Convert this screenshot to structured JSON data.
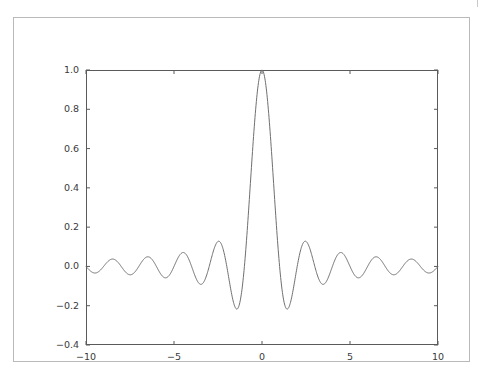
{
  "figure": {
    "background_color": "#ffffff",
    "frame_color": "#b9b9b9",
    "axes_color": "#5a5a5a",
    "line_color": "#6f6f6f",
    "tick_label_color": "#3a3a3a"
  },
  "chart_data": {
    "type": "line",
    "title": "",
    "xlabel": "",
    "ylabel": "",
    "xlim": [
      -10,
      10
    ],
    "ylim": [
      -0.4,
      1.0
    ],
    "grid": false,
    "legend": null,
    "xticks": [
      -10,
      -5,
      0,
      5,
      10
    ],
    "xticklabels": [
      "−10",
      "−5",
      "0",
      "5",
      "10"
    ],
    "yticks": [
      -0.4,
      -0.2,
      0.0,
      0.2,
      0.4,
      0.6,
      0.8,
      1.0
    ],
    "yticklabels": [
      "−0.4",
      "−0.2",
      "0.0",
      "0.2",
      "0.4",
      "0.6",
      "0.8",
      "1.0"
    ],
    "series": [
      {
        "name": "sinc(x)",
        "function": "sin(pi*x)/(pi*x)",
        "color": "#6f6f6f",
        "linewidth": 1.0,
        "peak": {
          "x": 0,
          "y": 1.0
        },
        "zero_crossings": [
          -9,
          -8,
          -7,
          -6,
          -5,
          -4,
          -3,
          -2,
          -1,
          1,
          2,
          3,
          4,
          5,
          6,
          7,
          8,
          9
        ],
        "local_extrema": [
          {
            "x": -9.48,
            "y": -0.0335
          },
          {
            "x": -8.48,
            "y": 0.0375
          },
          {
            "x": -7.48,
            "y": -0.0425
          },
          {
            "x": -6.48,
            "y": 0.0491
          },
          {
            "x": -5.48,
            "y": -0.058
          },
          {
            "x": -4.48,
            "y": 0.0709
          },
          {
            "x": -3.47,
            "y": -0.0913
          },
          {
            "x": -2.46,
            "y": 0.1284
          },
          {
            "x": -1.43,
            "y": -0.2172
          },
          {
            "x": 0.0,
            "y": 1.0
          },
          {
            "x": 1.43,
            "y": -0.2172
          },
          {
            "x": 2.46,
            "y": 0.1284
          },
          {
            "x": 3.47,
            "y": -0.0913
          },
          {
            "x": 4.48,
            "y": 0.0709
          },
          {
            "x": 5.48,
            "y": -0.058
          },
          {
            "x": 6.48,
            "y": 0.0491
          },
          {
            "x": 7.48,
            "y": -0.0425
          },
          {
            "x": 8.48,
            "y": 0.0375
          },
          {
            "x": 9.48,
            "y": -0.0335
          }
        ],
        "endpoints": [
          {
            "x": -10,
            "y": -3.89e-17
          },
          {
            "x": 10,
            "y": -3.89e-17
          }
        ]
      }
    ]
  }
}
